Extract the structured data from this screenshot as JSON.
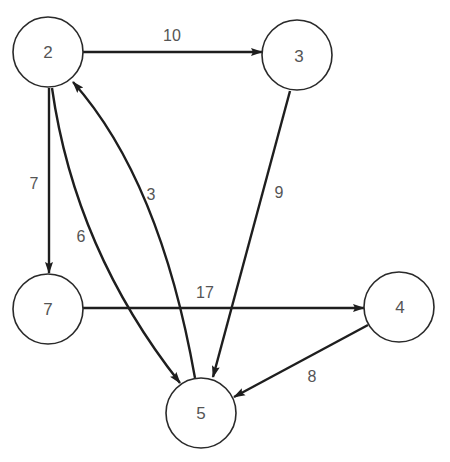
{
  "diagram": {
    "type": "directed-weighted-graph",
    "colors": {
      "node_stroke": "#2a2a2a",
      "edge_stroke": "#1e1e1e",
      "label_text": "#555555",
      "background": "#ffffff"
    },
    "nodes": [
      {
        "id": "2",
        "label": "2",
        "cx": 48,
        "cy": 52
      },
      {
        "id": "3",
        "label": "3",
        "cx": 297,
        "cy": 55
      },
      {
        "id": "7",
        "label": "7",
        "cx": 48,
        "cy": 309
      },
      {
        "id": "4",
        "label": "4",
        "cx": 399,
        "cy": 307
      },
      {
        "id": "5",
        "label": "5",
        "cx": 201,
        "cy": 412
      }
    ],
    "edges": [
      {
        "from": "2",
        "to": "3",
        "weight": "10"
      },
      {
        "from": "2",
        "to": "7",
        "weight": "7"
      },
      {
        "from": "2",
        "to": "5",
        "weight": "6"
      },
      {
        "from": "5",
        "to": "2",
        "weight": "3"
      },
      {
        "from": "3",
        "to": "5",
        "weight": "9"
      },
      {
        "from": "7",
        "to": "4",
        "weight": "17"
      },
      {
        "from": "4",
        "to": "5",
        "weight": "8"
      }
    ]
  }
}
